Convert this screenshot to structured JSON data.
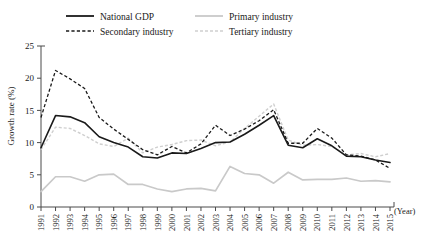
{
  "chart_data": {
    "type": "line",
    "title": "",
    "xlabel": "(Year)",
    "ylabel": "Growth rate (%)",
    "ylim": [
      0,
      25
    ],
    "y_ticks": [
      0,
      5,
      10,
      15,
      20,
      25
    ],
    "grid": false,
    "legend_position": "top",
    "categories": [
      "1991",
      "1992",
      "1993",
      "1994",
      "1995",
      "1996",
      "1997",
      "1998",
      "1999",
      "2000",
      "2001",
      "2002",
      "2003",
      "2004",
      "2005",
      "2006",
      "2007",
      "2008",
      "2009",
      "2010",
      "2011",
      "2012",
      "2013",
      "2014",
      "2015"
    ],
    "series": [
      {
        "name": "National GDP",
        "style": "solid-black",
        "color": "#1a1a1a",
        "values": [
          9.2,
          14.2,
          14.0,
          13.1,
          10.9,
          10.0,
          9.3,
          7.8,
          7.6,
          8.4,
          8.3,
          9.1,
          10.0,
          10.1,
          11.3,
          12.7,
          14.2,
          9.6,
          9.2,
          10.6,
          9.5,
          7.9,
          7.8,
          7.3,
          6.9
        ]
      },
      {
        "name": "Secondary industry",
        "style": "dashed-black",
        "color": "#1a1a1a",
        "values": [
          13.9,
          21.2,
          19.9,
          18.4,
          13.9,
          12.1,
          10.5,
          8.9,
          8.1,
          9.4,
          8.4,
          9.8,
          12.7,
          11.1,
          12.1,
          13.4,
          15.1,
          9.9,
          9.9,
          12.2,
          10.7,
          8.1,
          7.9,
          7.3,
          6.0
        ]
      },
      {
        "name": "Primary industry",
        "style": "solid-gray",
        "color": "#c9c9c9",
        "values": [
          2.4,
          4.7,
          4.7,
          4.0,
          5.0,
          5.1,
          3.5,
          3.5,
          2.8,
          2.4,
          2.8,
          2.9,
          2.5,
          6.3,
          5.2,
          5.0,
          3.7,
          5.4,
          4.2,
          4.3,
          4.3,
          4.5,
          4.0,
          4.1,
          3.9
        ]
      },
      {
        "name": "Tertiary industry",
        "style": "dashed-gray",
        "color": "#cfcfcf",
        "values": [
          8.9,
          12.4,
          12.2,
          11.1,
          9.8,
          9.4,
          10.7,
          8.4,
          9.3,
          9.7,
          10.3,
          10.4,
          9.5,
          10.1,
          12.2,
          14.1,
          16.0,
          10.4,
          9.6,
          9.7,
          9.4,
          8.1,
          8.3,
          7.8,
          8.3
        ]
      }
    ]
  },
  "legend": {
    "items": [
      {
        "label": "National GDP"
      },
      {
        "label": "Primary industry"
      },
      {
        "label": "Secondary industry"
      },
      {
        "label": "Tertiary industry"
      }
    ]
  },
  "axes": {
    "y_title": "Growth rate (%)",
    "x_title": "(Year)",
    "y_tick_labels": [
      "25",
      "20",
      "15",
      "10",
      "5",
      "0"
    ],
    "x_tick_labels": [
      "1991",
      "1992",
      "1993",
      "1994",
      "1995",
      "1996",
      "1997",
      "1998",
      "1999",
      "2000",
      "2001",
      "2002",
      "2003",
      "2004",
      "2005",
      "2006",
      "2007",
      "2008",
      "2009",
      "2010",
      "2011",
      "2012",
      "2013",
      "2014",
      "2015"
    ]
  }
}
